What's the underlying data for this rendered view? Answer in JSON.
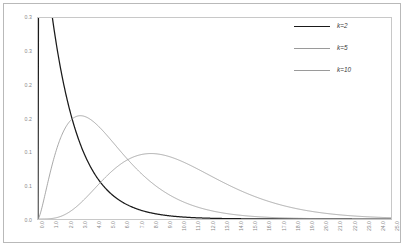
{
  "chart_data": {
    "type": "line",
    "title": "",
    "subtitle": "",
    "xlabel": "",
    "ylabel": "",
    "xlim": [
      0.0,
      25.0
    ],
    "ylim": [
      0.0,
      0.3
    ],
    "grid": false,
    "legend_position": "top-right",
    "x_tick_labels": [
      "0.0",
      "1.0",
      "2.0",
      "3.0",
      "4.0",
      "5.0",
      "6.0",
      "7.0",
      "8.0",
      "9.0",
      "10.0",
      "11.0",
      "12.0",
      "13.0",
      "14.0",
      "15.0",
      "16.0",
      "17.0",
      "18.0",
      "19.0",
      "20.0",
      "21.0",
      "22.0",
      "23.0",
      "24.0",
      "25.0"
    ],
    "x_tick_values": [
      0,
      1,
      2,
      3,
      4,
      5,
      6,
      7,
      8,
      9,
      10,
      11,
      12,
      13,
      14,
      15,
      16,
      17,
      18,
      19,
      20,
      21,
      22,
      23,
      24,
      25
    ],
    "y_tick_labels": [
      "0.0",
      "0.1",
      "0.1",
      "0.2",
      "0.2",
      "0.3",
      "0.3"
    ],
    "y_tick_values": [
      0.0,
      0.05,
      0.1,
      0.15,
      0.2,
      0.25,
      0.3
    ],
    "series": [
      {
        "name": "k=2",
        "color": "#1a1a1a",
        "x": [
          0.0,
          0.25,
          0.5,
          0.75,
          1.0,
          1.25,
          1.5,
          1.75,
          2.0,
          2.25,
          2.5,
          2.75,
          3.0,
          3.25,
          3.5,
          3.75,
          4.0,
          4.5,
          5.0,
          5.5,
          6.0,
          6.5,
          7.0,
          7.5,
          8.0,
          9.0,
          10.0,
          11.0,
          12.0,
          13.0,
          14.0,
          15.0,
          16.0,
          17.0,
          18.0,
          19.0,
          20.0,
          21.0,
          22.0,
          23.0,
          24.0,
          25.0
        ],
        "values": [
          0.5,
          0.4412,
          0.3894,
          0.3436,
          0.3033,
          0.2676,
          0.2362,
          0.2084,
          0.1839,
          0.1623,
          0.1433,
          0.1264,
          0.1116,
          0.0985,
          0.0869,
          0.0767,
          0.0677,
          0.0527,
          0.041,
          0.032,
          0.0249,
          0.0194,
          0.0151,
          0.0118,
          0.0092,
          0.0056,
          0.0034,
          0.002,
          0.0012,
          0.0008,
          0.0005,
          0.0003,
          0.0002,
          0.0001,
          0.0001,
          0.0,
          0.0,
          0.0,
          0.0,
          0.0,
          0.0,
          0.0
        ]
      },
      {
        "name": "k=5",
        "color": "#999999",
        "x": [
          0.0,
          0.25,
          0.5,
          0.75,
          1.0,
          1.25,
          1.5,
          1.75,
          2.0,
          2.25,
          2.5,
          2.75,
          3.0,
          3.25,
          3.5,
          3.75,
          4.0,
          4.5,
          5.0,
          5.5,
          6.0,
          6.5,
          7.0,
          7.5,
          8.0,
          9.0,
          10.0,
          11.0,
          12.0,
          13.0,
          14.0,
          15.0,
          16.0,
          17.0,
          18.0,
          19.0,
          20.0,
          21.0,
          22.0,
          23.0,
          24.0,
          25.0
        ],
        "values": [
          0.0,
          0.0279,
          0.0657,
          0.1005,
          0.1296,
          0.1522,
          0.1687,
          0.1798,
          0.1864,
          0.1891,
          0.1889,
          0.1863,
          0.162,
          0.1776,
          0.1703,
          0.1621,
          0.1562,
          0.14,
          0.122,
          0.1047,
          0.0889,
          0.0748,
          0.0624,
          0.0517,
          0.0426,
          0.0286,
          0.0189,
          0.0124,
          0.0081,
          0.0052,
          0.0033,
          0.0021,
          0.0013,
          0.0008,
          0.0005,
          0.0003,
          0.0002,
          0.0001,
          0.0001,
          0.0,
          0.0,
          0.0
        ],
        "peak_x": 3.0,
        "peak_y": 0.2015
      },
      {
        "name": "k=10",
        "color": "#999999",
        "x": [
          0.0,
          0.5,
          1.0,
          1.5,
          2.0,
          2.5,
          3.0,
          3.5,
          4.0,
          4.5,
          5.0,
          5.5,
          6.0,
          6.5,
          7.0,
          7.5,
          8.0,
          8.5,
          9.0,
          9.5,
          10.0,
          11.0,
          12.0,
          13.0,
          14.0,
          15.0,
          16.0,
          17.0,
          18.0,
          19.0,
          20.0,
          21.0,
          22.0,
          23.0,
          24.0,
          25.0
        ],
        "values": [
          0.0,
          0.0002,
          0.0016,
          0.0053,
          0.0115,
          0.0197,
          0.0292,
          0.0389,
          0.0482,
          0.0563,
          0.0628,
          0.0675,
          0.0705,
          0.0718,
          0.0717,
          0.0703,
          0.0681,
          0.0651,
          0.0616,
          0.0577,
          0.0537,
          0.0453,
          0.0372,
          0.03,
          0.0238,
          0.0186,
          0.0143,
          0.0109,
          0.0082,
          0.0061,
          0.0045,
          0.0033,
          0.0024,
          0.0017,
          0.0013,
          0.0009
        ],
        "peak_x": 8.0,
        "peak_y": 0.0947
      }
    ]
  },
  "legend": {
    "entries": [
      {
        "label": "k=2",
        "color": "#1a1a1a"
      },
      {
        "label": "k=5",
        "color": "#9a9a9a"
      },
      {
        "label": "k=10",
        "color": "#9a9a9a"
      }
    ]
  },
  "colors": {
    "background": "#ffffff",
    "frame": "#b9b9b9",
    "plot_border": "#c8c8c8",
    "tick_text": "#8a8a8a",
    "legend_text": "#3a3a3a",
    "series_dark": "#1a1a1a",
    "series_gray": "#999999"
  }
}
